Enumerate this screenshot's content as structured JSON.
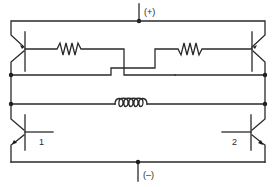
{
  "diagram": {
    "type": "circuit-schematic",
    "title": "",
    "terminals": {
      "positive": "(+)",
      "negative": "(–)"
    },
    "transistors": [
      {
        "id": "Q-top-left",
        "label": "",
        "kind": "PNP"
      },
      {
        "id": "Q-top-right",
        "label": "",
        "kind": "PNP"
      },
      {
        "id": "Q-bottom-left",
        "label": "1",
        "kind": "NPN"
      },
      {
        "id": "Q-bottom-right",
        "label": "2",
        "kind": "NPN"
      }
    ],
    "components": [
      {
        "id": "R-left",
        "kind": "resistor"
      },
      {
        "id": "R-right",
        "kind": "resistor"
      },
      {
        "id": "L-center",
        "kind": "inductor"
      }
    ],
    "colors": {
      "line": "#2a2a2a",
      "background": "#ffffff"
    }
  }
}
